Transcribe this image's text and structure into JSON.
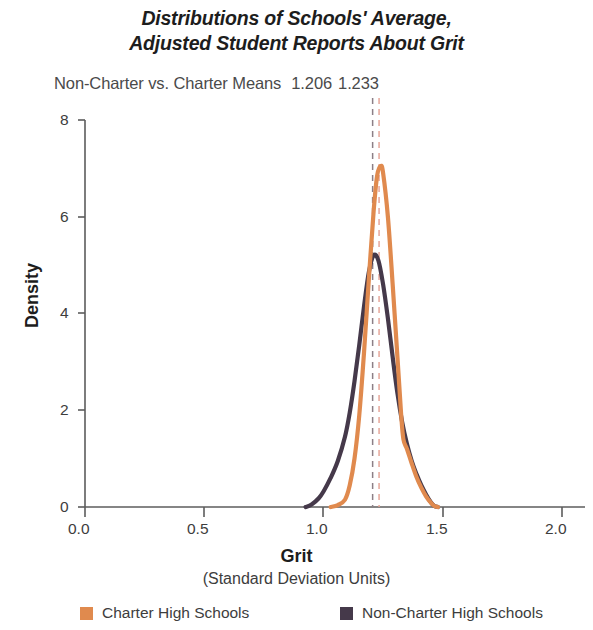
{
  "chart_data": {
    "type": "line",
    "title": "Distributions of Schools' Average, Adjusted Student Reports About Grit",
    "title_line1": "Distributions of Schools' Average,",
    "title_line2": "Adjusted Student Reports About Grit",
    "subtitle": "Non-Charter vs. Charter Means",
    "mean_noncharter": "1.206",
    "mean_charter": "1.233",
    "xlabel": "Grit",
    "xsublabel": "(Standard Deviation Units)",
    "ylabel": "Density",
    "xlim": [
      0.0,
      2.0
    ],
    "ylim": [
      0,
      8
    ],
    "xticks": [
      "0.0",
      "0.5",
      "1.0",
      "1.5",
      "2.0"
    ],
    "xtick_values": [
      0.0,
      0.5,
      1.0,
      1.5,
      2.0
    ],
    "yticks": [
      "0",
      "2",
      "4",
      "6",
      "8"
    ],
    "ytick_values": [
      0,
      2,
      4,
      6,
      8
    ],
    "grid": false,
    "legend_position": "bottom",
    "colors": {
      "charter": "#E08A4E",
      "noncharter": "#45394A",
      "mean_line_noncharter": "#8c7f86",
      "mean_line_charter": "#e6a79a",
      "axis": "#5c5c5c",
      "background": "#ffffff"
    },
    "series": [
      {
        "name": "Charter High Schools",
        "color": "#E08A4E",
        "mean": 1.233,
        "peak_density": 7.05,
        "peak_x": 1.24,
        "x": [
          1.03,
          1.06,
          1.09,
          1.11,
          1.13,
          1.15,
          1.17,
          1.19,
          1.21,
          1.225,
          1.24,
          1.25,
          1.27,
          1.29,
          1.31,
          1.325,
          1.335,
          1.35,
          1.37,
          1.39,
          1.41,
          1.43,
          1.45,
          1.465,
          1.48
        ],
        "values": [
          0.0,
          0.04,
          0.15,
          0.45,
          1.0,
          1.9,
          3.2,
          4.7,
          6.1,
          6.85,
          7.05,
          6.9,
          6.0,
          4.6,
          3.1,
          1.95,
          1.4,
          1.2,
          0.9,
          0.62,
          0.4,
          0.22,
          0.09,
          0.02,
          0.0
        ]
      },
      {
        "name": "Non-Charter High Schools",
        "color": "#45394A",
        "mean": 1.206,
        "peak_density": 5.2,
        "peak_x": 1.21,
        "x": [
          0.925,
          0.95,
          0.98,
          1.0,
          1.03,
          1.06,
          1.09,
          1.11,
          1.13,
          1.15,
          1.17,
          1.19,
          1.21,
          1.23,
          1.25,
          1.27,
          1.29,
          1.31,
          1.33,
          1.35,
          1.37,
          1.39,
          1.41,
          1.43,
          1.45,
          1.465,
          1.48
        ],
        "values": [
          0.0,
          0.05,
          0.18,
          0.32,
          0.6,
          0.95,
          1.45,
          1.95,
          2.6,
          3.35,
          4.15,
          4.85,
          5.2,
          5.1,
          4.6,
          3.9,
          3.1,
          2.35,
          1.75,
          1.3,
          0.95,
          0.68,
          0.45,
          0.26,
          0.1,
          0.02,
          0.0
        ]
      }
    ],
    "mean_lines": [
      {
        "name": "noncharter-mean-line",
        "value": 1.206,
        "color": "#8c7f86",
        "style": "dashed"
      },
      {
        "name": "charter-mean-line",
        "value": 1.233,
        "color": "#e6a79a",
        "style": "dashed"
      }
    ]
  },
  "legend": {
    "items": [
      {
        "label": "Charter High Schools",
        "color": "#E08A4E"
      },
      {
        "label": "Non-Charter High Schools",
        "color": "#45394A"
      }
    ]
  }
}
